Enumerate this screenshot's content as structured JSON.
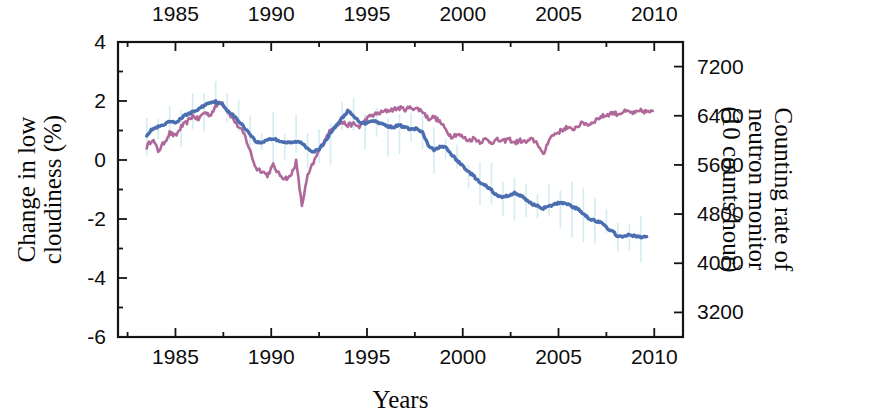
{
  "chart_data": {
    "type": "line",
    "title": "",
    "xlabel": "Years",
    "ylabel_left": "Change in low cloudiness (%)",
    "ylabel_right": "Counting rate of neutron monitor (10 counts/hour)",
    "ylabel_right_lines": [
      "Counting rate of",
      "neutron monitor",
      "(10 counts/hour)"
    ],
    "ylabel_left_lines": [
      "Change in low",
      "cloudiness (%)"
    ],
    "xlim": [
      1982.0,
      2011.5
    ],
    "xticks": [
      1985,
      1990,
      1995,
      2000,
      2005,
      2010
    ],
    "xticklabels": [
      "1985",
      "1990",
      "1995",
      "2000",
      "2005",
      "2010"
    ],
    "xminorticks": [
      1982.5,
      1987.5,
      1992.5,
      1997.5,
      2002.5,
      2007.5
    ],
    "ylim_left": [
      -6,
      4
    ],
    "yticks_left": [
      4,
      2,
      0,
      -2,
      -4,
      -6
    ],
    "yticklabels_left": [
      "4",
      "2",
      "0",
      "-2",
      "-4",
      "-6"
    ],
    "yminorticks_left": [
      3,
      1,
      -1,
      -3,
      -5
    ],
    "ylim_right": [
      2800,
      7600
    ],
    "yticks_right": [
      7200,
      6400,
      5600,
      4800,
      4000,
      3200
    ],
    "yticklabels_right": [
      "7200",
      "6400",
      "5600",
      "4800",
      "4000",
      "3200"
    ],
    "grid": false,
    "legend": "none",
    "axes_mirrored": "x axis duplicated on top and bottom; left axis in %, right axis in counting rate",
    "series": [
      {
        "name": "Change in low cloudiness",
        "color": "#4a6eb0",
        "axis": "left",
        "units": "%",
        "x": [
          1983.5,
          1983.8,
          1984.1,
          1984.4,
          1984.7,
          1985.0,
          1985.3,
          1985.6,
          1985.9,
          1986.2,
          1986.5,
          1986.8,
          1987.1,
          1987.4,
          1987.7,
          1988.0,
          1988.3,
          1988.6,
          1988.9,
          1989.2,
          1989.5,
          1989.8,
          1990.1,
          1990.4,
          1990.7,
          1991.0,
          1991.3,
          1991.6,
          1991.9,
          1992.2,
          1992.5,
          1992.8,
          1993.1,
          1993.4,
          1993.7,
          1994.0,
          1994.3,
          1994.6,
          1994.9,
          1995.2,
          1995.5,
          1995.8,
          1996.1,
          1996.4,
          1996.7,
          1997.0,
          1997.3,
          1997.6,
          1997.9,
          1998.2,
          1998.5,
          1998.8,
          1999.1,
          1999.4,
          1999.7,
          2000.0,
          2000.3,
          2000.6,
          2000.9,
          2001.2,
          2001.5,
          2001.8,
          2002.1,
          2002.4,
          2002.7,
          2003.0,
          2003.3,
          2003.6,
          2003.9,
          2004.2,
          2004.5,
          2004.8,
          2005.1,
          2005.4,
          2005.7,
          2006.0,
          2006.3,
          2006.6,
          2006.9,
          2007.2,
          2007.5,
          2007.8,
          2008.1,
          2008.4,
          2008.7,
          2009.0,
          2009.3,
          2009.6
        ],
        "y": [
          0.85,
          1.05,
          1.12,
          1.18,
          1.3,
          1.26,
          1.42,
          1.55,
          1.62,
          1.72,
          1.85,
          1.96,
          1.98,
          1.9,
          1.7,
          1.52,
          1.32,
          1.1,
          0.88,
          0.62,
          0.58,
          0.7,
          0.72,
          0.66,
          0.6,
          0.58,
          0.62,
          0.58,
          0.4,
          0.28,
          0.35,
          0.62,
          0.92,
          1.18,
          1.42,
          1.66,
          1.48,
          1.3,
          1.24,
          1.34,
          1.3,
          1.22,
          1.14,
          1.12,
          1.18,
          1.1,
          1.04,
          1.06,
          0.92,
          0.5,
          0.32,
          0.46,
          0.42,
          0.2,
          -0.02,
          -0.2,
          -0.4,
          -0.56,
          -0.78,
          -0.88,
          -1.02,
          -1.22,
          -1.26,
          -1.2,
          -1.12,
          -1.2,
          -1.34,
          -1.48,
          -1.56,
          -1.64,
          -1.58,
          -1.5,
          -1.44,
          -1.46,
          -1.58,
          -1.66,
          -1.82,
          -1.98,
          -2.06,
          -2.12,
          -2.28,
          -2.42,
          -2.58,
          -2.62,
          -2.52,
          -2.58,
          -2.62,
          -2.6
        ]
      },
      {
        "name": "Counting rate of neutron monitor",
        "color": "#b0679a",
        "axis": "right",
        "units": "10 counts/hour",
        "x": [
          1983.5,
          1983.8,
          1984.1,
          1984.4,
          1984.7,
          1985.0,
          1985.3,
          1985.6,
          1985.9,
          1986.2,
          1986.5,
          1986.8,
          1987.1,
          1987.4,
          1987.7,
          1988.0,
          1988.3,
          1988.6,
          1988.9,
          1989.2,
          1989.5,
          1989.8,
          1990.1,
          1990.4,
          1990.7,
          1991.0,
          1991.3,
          1991.6,
          1991.9,
          1992.2,
          1992.5,
          1992.8,
          1993.1,
          1993.4,
          1993.7,
          1994.0,
          1994.3,
          1994.6,
          1994.9,
          1995.2,
          1995.5,
          1995.8,
          1996.1,
          1996.4,
          1996.7,
          1997.0,
          1997.3,
          1997.6,
          1997.9,
          1998.2,
          1998.5,
          1998.8,
          1999.1,
          1999.4,
          1999.7,
          2000.0,
          2000.3,
          2000.6,
          2000.9,
          2001.2,
          2001.5,
          2001.8,
          2002.1,
          2002.4,
          2002.7,
          2003.0,
          2003.3,
          2003.6,
          2003.9,
          2004.2,
          2004.5,
          2004.8,
          2005.1,
          2005.4,
          2005.7,
          2006.0,
          2006.3,
          2006.6,
          2006.9,
          2007.2,
          2007.5,
          2007.8,
          2008.1,
          2008.4,
          2008.7,
          2009.0,
          2009.3,
          2009.6,
          2010.0,
          2010.4
        ],
        "y_percent_equiv": [
          0.45,
          0.72,
          0.3,
          0.58,
          0.92,
          0.8,
          1.12,
          1.28,
          1.5,
          1.38,
          1.62,
          1.52,
          1.8,
          2.0,
          1.68,
          1.4,
          1.12,
          0.86,
          0.3,
          -0.28,
          -0.36,
          -0.52,
          -0.18,
          -0.48,
          -0.62,
          -0.58,
          -0.05,
          -1.55,
          -0.55,
          -0.1,
          0.32,
          0.7,
          1.0,
          1.2,
          1.28,
          1.18,
          1.22,
          1.12,
          1.34,
          1.5,
          1.56,
          1.62,
          1.68,
          1.72,
          1.76,
          1.72,
          1.78,
          1.74,
          1.66,
          1.4,
          1.46,
          1.3,
          1.04,
          0.8,
          0.88,
          0.78,
          0.66,
          0.74,
          0.62,
          0.7,
          0.6,
          0.68,
          0.62,
          0.72,
          0.58,
          0.66,
          0.6,
          0.7,
          0.58,
          0.14,
          0.72,
          0.88,
          0.98,
          1.1,
          1.02,
          1.16,
          1.26,
          1.2,
          1.34,
          1.46,
          1.52,
          1.6,
          1.56,
          1.64,
          1.62,
          1.58,
          1.66,
          1.64,
          1.62
        ]
      },
      {
        "name": "uncertainty whiskers",
        "color": "#cdeaf2",
        "axis": "left",
        "style": "vertical error bars"
      }
    ]
  },
  "colors": {
    "cloudiness_line": "#4a6eb0",
    "neutron_line": "#b0679a",
    "error_bars": "#cdeaf2",
    "axis": "#141414",
    "background": "#ffffff"
  }
}
